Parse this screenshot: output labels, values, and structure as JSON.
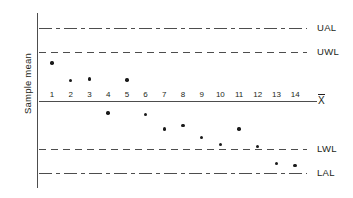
{
  "chart_data": {
    "type": "scatter",
    "title": "",
    "xlabel": "",
    "ylabel": "Sample mean",
    "x": [
      1,
      2,
      3,
      4,
      5,
      6,
      7,
      8,
      9,
      10,
      11,
      12,
      13,
      14
    ],
    "categories": [
      "1",
      "2",
      "3",
      "4",
      "5",
      "6",
      "7",
      "8",
      "9",
      "10",
      "11",
      "12",
      "13",
      "14"
    ],
    "values": [
      1.55,
      0.83,
      0.88,
      -0.52,
      0.85,
      -0.57,
      -1.17,
      -1.02,
      -1.53,
      -1.82,
      -1.17,
      -1.9,
      -2.58,
      -2.68
    ],
    "series": [
      {
        "name": "Sample mean",
        "values": [
          1.55,
          0.83,
          0.88,
          -0.52,
          0.85,
          -0.57,
          -1.17,
          -1.02,
          -1.53,
          -1.82,
          -1.17,
          -1.9,
          -2.58,
          -2.68
        ]
      }
    ],
    "control_limits": [
      {
        "key": "UAL",
        "label": "UAL",
        "value": 3.0,
        "style": "dashdot"
      },
      {
        "key": "UWL",
        "label": "UWL",
        "value": 2.0,
        "style": "dashed"
      },
      {
        "key": "CL",
        "label": "X̄",
        "value": 0.0,
        "style": "solid"
      },
      {
        "key": "LWL",
        "label": "LWL",
        "value": -2.0,
        "style": "dashed"
      },
      {
        "key": "LAL",
        "label": "LAL",
        "value": -3.0,
        "style": "dashdot"
      }
    ],
    "ylim": [
      -3.6,
      3.6
    ],
    "xlim": [
      0.3,
      14.9
    ],
    "grid": false,
    "legend": "none",
    "line_color": "#4d4d4d",
    "point_color": "#1a1a1a"
  },
  "labels": {
    "y_axis_title": "Sample mean",
    "ual": "UAL",
    "uwl": "UWL",
    "lwl": "LWL",
    "lal": "LAL",
    "centerline_symbol": "X"
  },
  "ticks": {
    "x": [
      "1",
      "2",
      "3",
      "4",
      "5",
      "6",
      "7",
      "8",
      "9",
      "10",
      "11",
      "12",
      "13",
      "14"
    ]
  }
}
